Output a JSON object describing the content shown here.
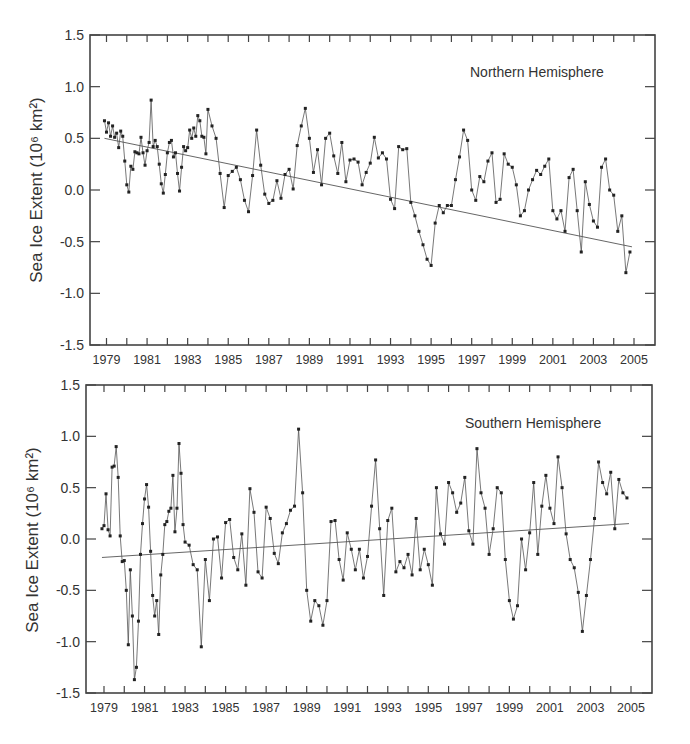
{
  "figure": {
    "ylabel": "Sea Ice Extent (10⁶ km²)",
    "y_ticks": [
      "1.5",
      "1.0",
      "0.5",
      "0.0",
      "-0.5",
      "-1.0",
      "-1.5"
    ],
    "x_ticks": [
      "1979",
      "1981",
      "1983",
      "1985",
      "1987",
      "1989",
      "1991",
      "1993",
      "1995",
      "1997",
      "1999",
      "2001",
      "2003",
      "2005"
    ]
  },
  "chart_data": [
    {
      "type": "line",
      "title": "Northern Hemisphere",
      "xlabel": "",
      "ylabel": "Sea Ice Extent (10^6 km^2)",
      "xlim": [
        1977.6,
        2005.8
      ],
      "ylim": [
        -1.5,
        1.5
      ],
      "grid": false,
      "legend": "none",
      "annotation": "Northern Hemisphere",
      "trend": {
        "start": [
          1978.9,
          0.5
        ],
        "end": [
          2004.9,
          -0.55
        ]
      },
      "series": [
        {
          "name": "Northern Hemisphere monthly anomaly",
          "x": [
            1978.9,
            1979.0,
            1979.1,
            1979.2,
            1979.3,
            1979.4,
            1979.5,
            1979.6,
            1979.7,
            1979.8,
            1979.9,
            1980.0,
            1980.1,
            1980.2,
            1980.3,
            1980.4,
            1980.5,
            1980.6,
            1980.7,
            1980.8,
            1980.9,
            1981.0,
            1981.1,
            1981.2,
            1981.3,
            1981.4,
            1981.5,
            1981.6,
            1981.7,
            1981.8,
            1981.9,
            1982.0,
            1982.1,
            1982.2,
            1982.3,
            1982.4,
            1982.5,
            1982.6,
            1982.7,
            1982.8,
            1982.9,
            1983.0,
            1983.1,
            1983.2,
            1983.3,
            1983.4,
            1983.5,
            1983.6,
            1983.7,
            1983.8,
            1983.9,
            1984.0,
            1984.2,
            1984.4,
            1984.6,
            1984.8,
            1985.0,
            1985.2,
            1985.4,
            1985.6,
            1985.8,
            1986.0,
            1986.2,
            1986.4,
            1986.6,
            1986.8,
            1987.0,
            1987.2,
            1987.4,
            1987.6,
            1987.8,
            1988.0,
            1988.2,
            1988.4,
            1988.6,
            1988.8,
            1989.0,
            1989.2,
            1989.4,
            1989.6,
            1989.8,
            1990.0,
            1990.2,
            1990.4,
            1990.6,
            1990.8,
            1991.0,
            1991.2,
            1991.4,
            1991.6,
            1991.8,
            1992.0,
            1992.2,
            1992.4,
            1992.6,
            1992.8,
            1993.0,
            1993.2,
            1993.4,
            1993.6,
            1993.8,
            1994.0,
            1994.2,
            1994.4,
            1994.6,
            1994.8,
            1995.0,
            1995.2,
            1995.4,
            1995.6,
            1995.8,
            1996.0,
            1996.2,
            1996.4,
            1996.6,
            1996.8,
            1997.0,
            1997.2,
            1997.4,
            1997.6,
            1997.8,
            1998.0,
            1998.2,
            1998.4,
            1998.6,
            1998.8,
            1999.0,
            1999.2,
            1999.4,
            1999.6,
            1999.8,
            2000.0,
            2000.2,
            2000.4,
            2000.6,
            2000.8,
            2001.0,
            2001.2,
            2001.4,
            2001.6,
            2001.8,
            2002.0,
            2002.2,
            2002.4,
            2002.6,
            2002.8,
            2003.0,
            2003.2,
            2003.4,
            2003.6,
            2003.8,
            2004.0,
            2004.2,
            2004.4,
            2004.6,
            2004.8
          ],
          "y": [
            0.67,
            0.56,
            0.65,
            0.52,
            0.62,
            0.51,
            0.55,
            0.41,
            0.57,
            0.52,
            0.28,
            0.05,
            -0.02,
            0.23,
            0.2,
            0.37,
            0.36,
            0.35,
            0.51,
            0.36,
            0.24,
            0.38,
            0.46,
            0.87,
            0.42,
            0.48,
            0.42,
            0.25,
            0.06,
            -0.03,
            0.15,
            0.36,
            0.46,
            0.48,
            0.32,
            0.36,
            0.16,
            -0.01,
            0.22,
            0.42,
            0.38,
            0.41,
            0.58,
            0.5,
            0.6,
            0.52,
            0.72,
            0.67,
            0.52,
            0.51,
            0.35,
            0.78,
            0.62,
            0.5,
            0.16,
            -0.17,
            0.14,
            0.18,
            0.22,
            0.1,
            -0.1,
            -0.21,
            0.14,
            0.58,
            0.24,
            -0.04,
            -0.13,
            -0.1,
            0.09,
            -0.08,
            0.15,
            0.2,
            0.01,
            0.43,
            0.62,
            0.79,
            0.5,
            0.17,
            0.39,
            0.05,
            0.5,
            0.55,
            0.33,
            0.16,
            0.46,
            0.08,
            0.29,
            0.3,
            0.27,
            0.05,
            0.17,
            0.26,
            0.51,
            0.31,
            0.36,
            0.3,
            -0.09,
            -0.18,
            0.42,
            0.39,
            0.4,
            -0.12,
            -0.25,
            -0.4,
            -0.53,
            -0.67,
            -0.73,
            -0.32,
            -0.15,
            -0.22,
            -0.15,
            -0.15,
            0.1,
            0.32,
            0.58,
            0.48,
            0.0,
            -0.1,
            0.13,
            0.08,
            0.28,
            0.36,
            -0.12,
            -0.09,
            0.35,
            0.25,
            0.22,
            0.05,
            -0.25,
            -0.2,
            0.0,
            0.1,
            0.19,
            0.15,
            0.23,
            0.3,
            -0.2,
            -0.28,
            -0.2,
            -0.4,
            0.12,
            0.2,
            -0.2,
            -0.6,
            0.08,
            -0.14,
            -0.3,
            -0.36,
            0.22,
            0.3,
            0.0,
            -0.05,
            -0.4,
            -0.25,
            -0.8,
            -0.6,
            -0.45,
            -0.5,
            -0.2,
            -0.3,
            -0.55
          ],
          "values_note": "approximate monthly sampling read from plot"
        }
      ]
    },
    {
      "type": "line",
      "title": "Southern Hemisphere",
      "xlabel": "",
      "ylabel": "Sea Ice Extent (10^6 km^2)",
      "xlim": [
        1977.6,
        2005.8
      ],
      "ylim": [
        -1.5,
        1.5
      ],
      "grid": false,
      "legend": "none",
      "annotation": "Southern Hemisphere",
      "trend": {
        "start": [
          1978.9,
          -0.18
        ],
        "end": [
          2004.9,
          0.15
        ]
      },
      "series": [
        {
          "name": "Southern Hemisphere monthly anomaly",
          "x": [
            1978.9,
            1979.0,
            1979.1,
            1979.2,
            1979.3,
            1979.4,
            1979.5,
            1979.6,
            1979.7,
            1979.8,
            1979.9,
            1980.0,
            1980.1,
            1980.2,
            1980.3,
            1980.4,
            1980.5,
            1980.6,
            1980.7,
            1980.8,
            1980.9,
            1981.0,
            1981.1,
            1981.2,
            1981.3,
            1981.4,
            1981.5,
            1981.6,
            1981.7,
            1981.8,
            1981.9,
            1982.0,
            1982.1,
            1982.2,
            1982.3,
            1982.4,
            1982.5,
            1982.6,
            1982.7,
            1982.8,
            1982.9,
            1983.0,
            1983.2,
            1983.4,
            1983.6,
            1983.8,
            1984.0,
            1984.2,
            1984.4,
            1984.6,
            1984.8,
            1985.0,
            1985.2,
            1985.4,
            1985.6,
            1985.8,
            1986.0,
            1986.2,
            1986.4,
            1986.6,
            1986.8,
            1987.0,
            1987.2,
            1987.4,
            1987.6,
            1987.8,
            1988.0,
            1988.2,
            1988.4,
            1988.6,
            1988.8,
            1989.0,
            1989.2,
            1989.4,
            1989.6,
            1989.8,
            1990.0,
            1990.2,
            1990.4,
            1990.6,
            1990.8,
            1991.0,
            1991.2,
            1991.4,
            1991.6,
            1991.8,
            1992.0,
            1992.2,
            1992.4,
            1992.6,
            1992.8,
            1993.0,
            1993.2,
            1993.4,
            1993.6,
            1993.8,
            1994.0,
            1994.2,
            1994.4,
            1994.6,
            1994.8,
            1995.0,
            1995.2,
            1995.4,
            1995.6,
            1995.8,
            1996.0,
            1996.2,
            1996.4,
            1996.6,
            1996.8,
            1997.0,
            1997.2,
            1997.4,
            1997.6,
            1997.8,
            1998.0,
            1998.2,
            1998.4,
            1998.6,
            1998.8,
            1999.0,
            1999.2,
            1999.4,
            1999.6,
            1999.8,
            2000.0,
            2000.2,
            2000.4,
            2000.6,
            2000.8,
            2001.0,
            2001.2,
            2001.4,
            2001.6,
            2001.8,
            2002.0,
            2002.2,
            2002.4,
            2002.6,
            2002.8,
            2003.0,
            2003.2,
            2003.4,
            2003.6,
            2003.8,
            2004.0,
            2004.2,
            2004.4,
            2004.6,
            2004.8
          ],
          "y": [
            0.1,
            0.13,
            0.44,
            0.09,
            0.03,
            0.7,
            0.71,
            0.9,
            0.6,
            0.03,
            -0.22,
            -0.21,
            -0.5,
            -1.03,
            -0.3,
            -0.75,
            -1.37,
            -1.25,
            -0.8,
            -0.15,
            0.15,
            0.39,
            0.53,
            0.31,
            -0.12,
            -0.55,
            -0.75,
            -0.6,
            -0.93,
            -0.35,
            -0.15,
            0.14,
            0.17,
            0.27,
            0.3,
            0.62,
            0.07,
            0.3,
            0.93,
            0.64,
            0.14,
            -0.03,
            -0.06,
            -0.25,
            -0.3,
            -1.05,
            -0.2,
            -0.6,
            0.0,
            0.02,
            -0.38,
            0.16,
            0.19,
            -0.18,
            -0.3,
            0.05,
            -0.45,
            0.49,
            0.26,
            -0.32,
            -0.38,
            0.31,
            0.2,
            -0.14,
            -0.24,
            0.06,
            0.15,
            0.28,
            0.32,
            1.07,
            0.45,
            -0.5,
            -0.8,
            -0.6,
            -0.65,
            -0.84,
            -0.6,
            0.17,
            0.18,
            -0.2,
            -0.4,
            0.06,
            -0.1,
            -0.3,
            -0.1,
            -0.38,
            -0.17,
            0.32,
            0.77,
            0.1,
            -0.55,
            0.18,
            0.3,
            -0.32,
            -0.22,
            -0.28,
            -0.15,
            -0.35,
            0.2,
            -0.3,
            -0.1,
            -0.25,
            -0.45,
            0.5,
            0.05,
            -0.05,
            0.55,
            0.45,
            0.26,
            0.35,
            0.6,
            0.08,
            -0.05,
            0.88,
            0.45,
            0.3,
            -0.15,
            0.1,
            0.5,
            0.45,
            -0.2,
            -0.6,
            -0.78,
            -0.65,
            0.0,
            -0.3,
            0.06,
            0.55,
            -0.15,
            0.32,
            0.62,
            0.3,
            0.15,
            0.8,
            0.5,
            0.05,
            -0.2,
            -0.28,
            -0.52,
            -0.9,
            -0.55,
            -0.2,
            0.2,
            0.75,
            0.55,
            0.44,
            0.65,
            0.1,
            0.58,
            0.45,
            0.4,
            0.45,
            0.25,
            -0.08
          ],
          "values_note": "approximate monthly sampling read from plot"
        }
      ]
    }
  ]
}
